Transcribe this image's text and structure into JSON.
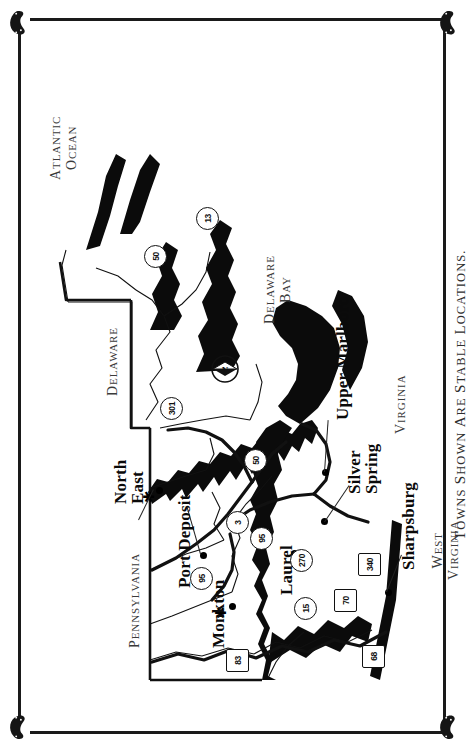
{
  "document": {
    "caption": "Towns Shown Are Stable Locations.",
    "orientation": "landscape-rotated-90ccw"
  },
  "ornaments": {
    "corner_icon": "horseshoe-icon",
    "corners": [
      "top-left",
      "top-right",
      "bottom-left",
      "bottom-right"
    ]
  },
  "map": {
    "title_region": "Maryland",
    "compass": {
      "icon": "compass-rose-icon",
      "label": "N"
    },
    "towns": [
      {
        "name": "Port Deposit",
        "marker": "dot",
        "lines": [
          "Port Deposit"
        ]
      },
      {
        "name": "Monkton",
        "marker": "dot-star",
        "lines": [
          "Monkton"
        ]
      },
      {
        "name": "North East",
        "marker": "dot-star",
        "lines": [
          "North",
          "East"
        ]
      },
      {
        "name": "Laurel",
        "marker": "dot",
        "lines": [
          "Laurel"
        ]
      },
      {
        "name": "Silver Spring",
        "marker": "dot",
        "lines": [
          "Silver",
          "Spring"
        ]
      },
      {
        "name": "Upper Marlboro",
        "marker": "dot",
        "lines": [
          "Upper Marlboro"
        ]
      },
      {
        "name": "Sharpsburg",
        "marker": "dot",
        "lines": [
          "Sharpsburg"
        ]
      }
    ],
    "regions": [
      {
        "label": "Pennsylvania",
        "lines": [
          "Pennsylvania"
        ]
      },
      {
        "label": "West Virginia",
        "lines": [
          "West",
          "Virginia"
        ]
      },
      {
        "label": "Virginia",
        "lines": [
          "Virginia"
        ]
      },
      {
        "label": "Delaware",
        "lines": [
          "Delaware"
        ]
      },
      {
        "label": "Delaware Bay",
        "lines": [
          "Delaware",
          "Bay"
        ]
      },
      {
        "label": "Atlantic Ocean",
        "lines": [
          "Atlantic",
          "Ocean"
        ]
      }
    ],
    "highway_shields": [
      {
        "number": "83"
      },
      {
        "number": "3"
      },
      {
        "number": "95"
      },
      {
        "number": "95"
      },
      {
        "number": "15"
      },
      {
        "number": "270"
      },
      {
        "number": "70"
      },
      {
        "number": "340"
      },
      {
        "number": "68"
      },
      {
        "number": "68"
      },
      {
        "number": "220"
      },
      {
        "number": "219"
      },
      {
        "number": "50"
      },
      {
        "number": "50"
      },
      {
        "number": "50"
      },
      {
        "number": "301"
      },
      {
        "number": "13"
      }
    ]
  },
  "colors": {
    "ink": "#111111",
    "paper": "#ffffff",
    "region_text": "#3a3a3a",
    "water_fill": "#000000"
  }
}
